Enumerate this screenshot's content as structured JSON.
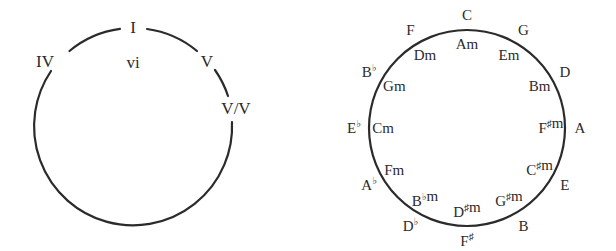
{
  "left_diagram": {
    "title": "Roman numeral chord circle",
    "labels": {
      "tonic": "I",
      "subdominant": "IV",
      "relative_minor": "vi",
      "dominant": "V",
      "secondary_dominant": "V/V"
    }
  },
  "right_diagram": {
    "title": "Circle of fifths",
    "keys": [
      {
        "major": "C",
        "minor": "Am"
      },
      {
        "major": "G",
        "minor": "Em"
      },
      {
        "major": "D",
        "minor": "Bm"
      },
      {
        "major": "A",
        "minor": "F♯m"
      },
      {
        "major": "E",
        "minor": "C♯m"
      },
      {
        "major": "B",
        "minor": "G♯m"
      },
      {
        "major": "F♯",
        "minor": "D♯m"
      },
      {
        "major": "D♭",
        "minor": "B♭m"
      },
      {
        "major": "A♭",
        "minor": "Fm"
      },
      {
        "major": "E♭",
        "minor": "Cm"
      },
      {
        "major": "B♭",
        "minor": "Gm"
      },
      {
        "major": "F",
        "minor": "Dm"
      }
    ]
  },
  "colors": {
    "line": "#2b2b2b",
    "text": "#2b2b2b",
    "background": "#ffffff"
  }
}
